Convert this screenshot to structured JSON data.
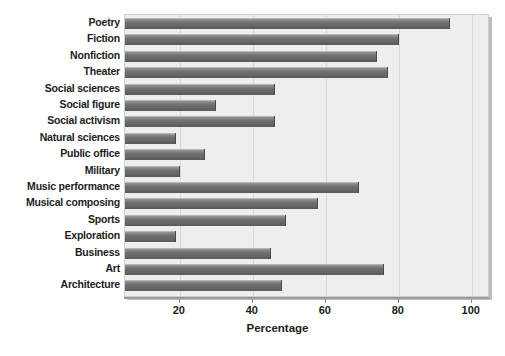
{
  "chart_data": {
    "type": "bar",
    "orientation": "horizontal",
    "title": "",
    "xlabel": "Percentage",
    "ylabel": "",
    "xlim": [
      5,
      105
    ],
    "xticks": [
      20,
      40,
      60,
      80,
      100
    ],
    "xtick_labels": [
      "20",
      "40",
      "60",
      "80",
      "100"
    ],
    "grid": true,
    "grid_axis": "x",
    "legend": null,
    "bar_color": "#6a6a6a",
    "plot_background": "#eeeeee",
    "categories": [
      "Poetry",
      "Fiction",
      "Nonfiction",
      "Theater",
      "Social sciences",
      "Social figure",
      "Social activism",
      "Natural sciences",
      "Public office",
      "Military",
      "Music performance",
      "Musical composing",
      "Sports",
      "Exploration",
      "Business",
      "Art",
      "Architecture"
    ],
    "values": [
      94,
      80,
      74,
      77,
      46,
      30,
      46,
      19,
      27,
      20,
      69,
      58,
      49,
      19,
      45,
      76,
      48
    ]
  }
}
